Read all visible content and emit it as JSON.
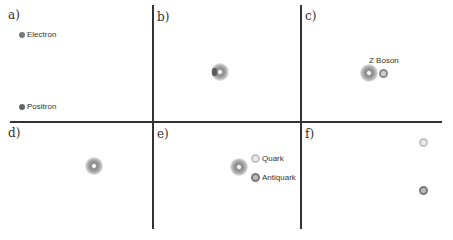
{
  "figure": {
    "panels": [
      {
        "id": "a",
        "label": "a)"
      },
      {
        "id": "b",
        "label": "b)"
      },
      {
        "id": "c",
        "label": "c)"
      },
      {
        "id": "d",
        "label": "d)"
      },
      {
        "id": "e",
        "label": "e)"
      },
      {
        "id": "f",
        "label": "f)"
      }
    ],
    "labels": {
      "electron": "Electron",
      "positron": "Positron",
      "z_boson": "Z Boson",
      "quark": "Quark",
      "antiquark": "Antiquark"
    },
    "colors": {
      "lines": "#333333",
      "electron": "#6a6a6a",
      "positron": "#6a6a6a",
      "quark": "#c4c4c4",
      "antiquark": "#7a7a7a",
      "burst": "#8a8a8a"
    }
  }
}
